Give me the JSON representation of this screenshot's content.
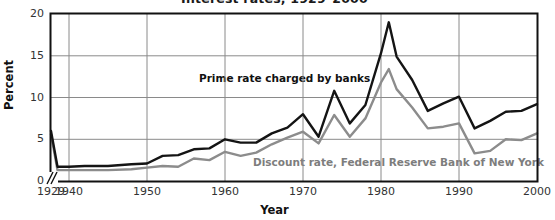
{
  "chart_data": {
    "type": "line",
    "title": "Interest rates, 1929–2000",
    "xlabel": "Year",
    "ylabel": "Percent",
    "xlim": [
      1929,
      2000
    ],
    "ylim": [
      0,
      20
    ],
    "yticks": [
      "0",
      "5",
      "10",
      "15",
      "20"
    ],
    "ytick_values": [
      0,
      5,
      10,
      15,
      20
    ],
    "xticks": [
      "1929",
      "1940",
      "1950",
      "1960",
      "1970",
      "1980",
      "1990",
      "2000"
    ],
    "xtick_values": [
      1929,
      1940,
      1950,
      1960,
      1970,
      1980,
      1990,
      2000
    ],
    "grid": true,
    "legend_position": "inline-annotations",
    "axis_break": "//",
    "axis_break_note": "x-axis broken between 1929 and 1940",
    "x": [
      1929,
      1933,
      1936,
      1940,
      1942,
      1945,
      1948,
      1950,
      1952,
      1954,
      1956,
      1958,
      1960,
      1962,
      1964,
      1966,
      1968,
      1970,
      1972,
      1974,
      1976,
      1978,
      1980,
      1981,
      1982,
      1984,
      1986,
      1988,
      1990,
      1992,
      1994,
      1996,
      1998,
      2000
    ],
    "series": [
      {
        "name": "Prime rate charged by banks",
        "color": "#141414",
        "values": [
          6.0,
          1.7,
          1.7,
          1.7,
          1.8,
          1.8,
          2.0,
          2.1,
          3.0,
          3.1,
          3.8,
          3.9,
          5.0,
          4.6,
          4.6,
          5.7,
          6.4,
          8.0,
          5.3,
          10.8,
          6.9,
          9.1,
          15.3,
          19.0,
          14.9,
          12.1,
          8.4,
          9.3,
          10.1,
          6.3,
          7.2,
          8.3,
          8.4,
          9.2
        ]
      },
      {
        "name": "Discount rate, Federal Reserve Bank of New York",
        "color": "#8c8c8c",
        "values": [
          5.6,
          1.3,
          1.3,
          1.3,
          1.3,
          1.3,
          1.4,
          1.6,
          1.8,
          1.7,
          2.7,
          2.5,
          3.5,
          3.0,
          3.4,
          4.4,
          5.2,
          5.9,
          4.5,
          7.9,
          5.3,
          7.5,
          11.8,
          13.4,
          11.0,
          8.8,
          6.3,
          6.5,
          6.9,
          3.3,
          3.6,
          5.0,
          4.9,
          5.7
        ]
      }
    ]
  }
}
